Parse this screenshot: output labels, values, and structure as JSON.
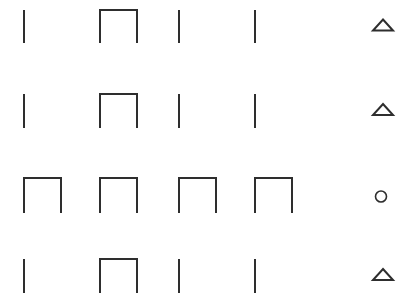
{
  "colors": {
    "stroke": "#2e2e2e",
    "background": "#ffffff"
  },
  "rows": [
    {
      "y": 10,
      "h": 33,
      "cells": [
        "line",
        "box",
        "line",
        "line"
      ],
      "marker": "triangle-icon"
    },
    {
      "y": 94,
      "h": 34,
      "cells": [
        "line",
        "box",
        "line",
        "line"
      ],
      "marker": "triangle-icon"
    },
    {
      "y": 178,
      "h": 35,
      "cells": [
        "box",
        "box",
        "box",
        "box"
      ],
      "marker": "circle-icon"
    },
    {
      "y": 259,
      "h": 34,
      "cells": [
        "line",
        "box",
        "line",
        "line"
      ],
      "marker": "triangle-icon"
    }
  ],
  "columns_x": [
    24,
    100,
    179,
    255
  ],
  "box_width": 37
}
